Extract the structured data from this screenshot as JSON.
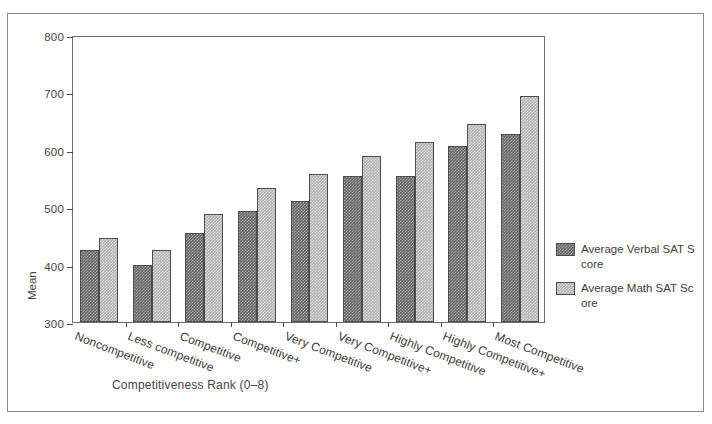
{
  "chart_data": {
    "type": "bar",
    "title": "",
    "xlabel": "Competitiveness Rank (0–8)",
    "ylabel": "Mean",
    "ylim": [
      300,
      800
    ],
    "yticks": [
      300,
      400,
      500,
      600,
      700,
      800
    ],
    "grid": false,
    "legend_position": "right-outside",
    "categories": [
      "Noncompetitive",
      "Less competitive",
      "Competitive",
      "Competitive+",
      "Very Competitive",
      "Very Competitive+",
      "Highly Competitive",
      "Highly Competitive+",
      "Most Competitive"
    ],
    "series": [
      {
        "name": "Average Verbal SAT Score",
        "color": "#6b6b6b",
        "values": [
          426,
          400,
          455,
          493,
          511,
          555,
          555,
          607,
          627
        ]
      },
      {
        "name": "Average Math SAT Score",
        "color": "#b6b6b6",
        "values": [
          446,
          426,
          488,
          534,
          558,
          589,
          614,
          645,
          694
        ]
      }
    ]
  },
  "axes": {
    "y_title": "Mean",
    "x_title": "Competitiveness Rank (0–8)",
    "y_tick_labels": [
      "800",
      "700",
      "600",
      "500",
      "400",
      "300"
    ]
  },
  "legend": {
    "items": [
      {
        "label": "Average Verbal SAT Score",
        "swatch": "verbal"
      },
      {
        "label": "Average Math SAT Score",
        "swatch": "math"
      }
    ]
  }
}
